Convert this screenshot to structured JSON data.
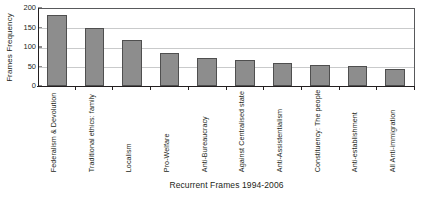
{
  "chart_data": {
    "type": "bar",
    "title": "",
    "xlabel": "Recurrent Frames 1994-2006",
    "ylabel": "Frames Frequency",
    "ylim": [
      0,
      200
    ],
    "yticks": [
      0,
      50,
      100,
      150,
      200
    ],
    "grid": true,
    "legend": null,
    "categories": [
      "Federalism & Devolution",
      "Traditional ethics: family",
      "Localism",
      "Pro-Welfare",
      "Anti-Bureaucracy",
      "Against Centralised state",
      "Anti-Assistentialism",
      "Constituency: The people",
      "Anti-establishment",
      "All Anti-immigration"
    ],
    "values": [
      185,
      150,
      120,
      85,
      72,
      67,
      60,
      55,
      52,
      45
    ],
    "bar_color": "#8d8d8d",
    "bar_edge_color": "#4f4f4f",
    "grid_color": "#c9cacb",
    "axis_color": "#231f20"
  }
}
